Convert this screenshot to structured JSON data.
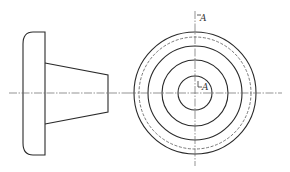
{
  "drawing": {
    "type": "orthographic-projection",
    "views": [
      {
        "name": "side-view",
        "flange": {
          "x_left": 23,
          "x_right": 45,
          "y_top": 32,
          "y_bottom": 155,
          "corner_radius": 10
        },
        "cone": {
          "x_start": 45,
          "x_end": 108,
          "start_top": 63,
          "start_bottom": 124,
          "end_top": 75,
          "end_bottom": 112
        },
        "centerline_y": 93
      },
      {
        "name": "front-view",
        "center": {
          "x": 195,
          "y": 93
        },
        "circles": [
          {
            "r": 61,
            "style": "solid"
          },
          {
            "r": 56,
            "style": "hidden"
          },
          {
            "r": 47,
            "style": "solid"
          },
          {
            "r": 33,
            "style": "solid"
          },
          {
            "r": 17,
            "style": "solid"
          }
        ]
      }
    ],
    "section_labels": {
      "top": "A",
      "center": "A"
    },
    "colors": {
      "line": "#2a2a2a",
      "background": "#ffffff"
    }
  }
}
